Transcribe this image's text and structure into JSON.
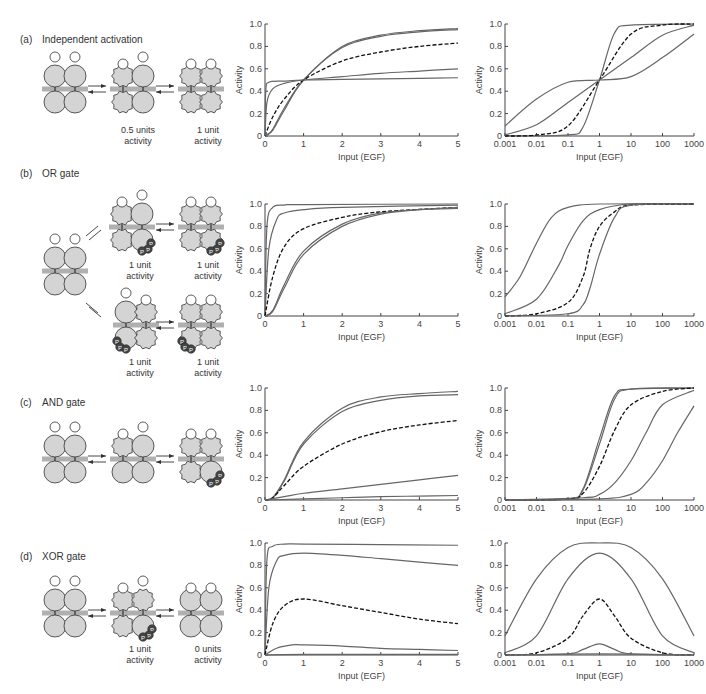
{
  "panels": [
    {
      "id": "a",
      "letter": "(a)",
      "title": "Independent activation",
      "states": [
        {
          "label": ""
        },
        {
          "label": "0.5 units\nactivity",
          "l1": "0.5 units",
          "l2": "activity"
        },
        {
          "label": "1 unit\nactivity",
          "l1": "1 unit",
          "l2": "activity"
        }
      ]
    },
    {
      "id": "b",
      "letter": "(b)",
      "title": "OR gate",
      "states": [
        {
          "l1": "1 unit",
          "l2": "activity"
        },
        {
          "l1": "1 unit",
          "l2": "activity"
        },
        {
          "l1": "1 unit",
          "l2": "activity"
        },
        {
          "l1": "1 unit",
          "l2": "activity"
        }
      ]
    },
    {
      "id": "c",
      "letter": "(c)",
      "title": "AND gate",
      "states": []
    },
    {
      "id": "d",
      "letter": "(d)",
      "title": "XOR gate",
      "states": [
        {
          "l1": "1 unit",
          "l2": "activity"
        },
        {
          "l1": "0 units",
          "l2": "activity"
        }
      ]
    }
  ],
  "axes": {
    "ylabel": "Activity",
    "xlabel": "Input (EGF)",
    "yticks": [
      "0",
      "0.2",
      "0.4",
      "0.6",
      "0.8",
      "1.0"
    ],
    "linear_xticks": [
      "0",
      "1",
      "2",
      "3",
      "4",
      "5"
    ],
    "log_xticks": [
      "0.001",
      "0.01",
      "0.1",
      "1",
      "10",
      "100",
      "1000"
    ]
  },
  "colors": {
    "curve": "#666666",
    "dashed": "#111111",
    "protein": "#d4d4d4",
    "membrane": "#b0b0b0",
    "phospho": "#444444",
    "ligand": "#ffffff"
  },
  "chart_data": [
    {
      "panel": "a",
      "type": "line",
      "scale": "linear",
      "xlabel": "Input (EGF)",
      "ylabel": "Activity",
      "xlim": [
        0,
        5
      ],
      "ylim": [
        0,
        1
      ],
      "series": [
        {
          "name": "steep-1",
          "style": "solid",
          "x": [
            0,
            0.05,
            0.2,
            0.5,
            1,
            2,
            3,
            4,
            5
          ],
          "y": [
            0,
            0.01,
            0.06,
            0.25,
            0.5,
            0.8,
            0.9,
            0.94,
            0.96
          ]
        },
        {
          "name": "steep-2",
          "style": "solid",
          "x": [
            0,
            0.05,
            0.2,
            0.5,
            1,
            2,
            3,
            4,
            5
          ],
          "y": [
            0,
            0.01,
            0.05,
            0.23,
            0.5,
            0.79,
            0.89,
            0.93,
            0.95
          ]
        },
        {
          "name": "hyperbolic",
          "style": "dashed",
          "x": [
            0,
            0.2,
            0.5,
            1,
            2,
            3,
            4,
            5
          ],
          "y": [
            0,
            0.17,
            0.33,
            0.5,
            0.67,
            0.75,
            0.8,
            0.83
          ]
        },
        {
          "name": "shallow-1",
          "style": "solid",
          "x": [
            0,
            0.05,
            0.2,
            0.5,
            1,
            2,
            3,
            4,
            5
          ],
          "y": [
            0,
            0.3,
            0.42,
            0.47,
            0.5,
            0.53,
            0.56,
            0.58,
            0.6
          ]
        },
        {
          "name": "shallow-2",
          "style": "solid",
          "x": [
            0,
            0.02,
            0.1,
            0.5,
            1,
            2,
            3,
            4,
            5
          ],
          "y": [
            0,
            0.4,
            0.48,
            0.49,
            0.5,
            0.505,
            0.51,
            0.515,
            0.52
          ]
        }
      ]
    },
    {
      "panel": "a",
      "type": "line",
      "scale": "log",
      "xlabel": "Input (EGF)",
      "ylabel": "Activity",
      "xlim": [
        0.001,
        1000
      ],
      "ylim": [
        0,
        1
      ],
      "series": [
        {
          "name": "steep",
          "style": "solid",
          "x": [
            0.001,
            0.1,
            0.3,
            1,
            3,
            10,
            1000
          ],
          "y": [
            0,
            0.01,
            0.08,
            0.5,
            0.92,
            0.99,
            1
          ]
        },
        {
          "name": "hyperbolic",
          "style": "dashed",
          "x": [
            0.001,
            0.01,
            0.1,
            1,
            10,
            100,
            1000
          ],
          "y": [
            0,
            0.01,
            0.09,
            0.5,
            0.91,
            0.99,
            1
          ]
        },
        {
          "name": "mid",
          "style": "solid",
          "x": [
            0.001,
            0.01,
            0.1,
            1,
            10,
            100,
            1000
          ],
          "y": [
            0.01,
            0.1,
            0.3,
            0.5,
            0.7,
            0.9,
            0.99
          ]
        },
        {
          "name": "shallow",
          "style": "solid",
          "x": [
            0.001,
            0.01,
            0.1,
            1,
            10,
            100,
            1000
          ],
          "y": [
            0.09,
            0.33,
            0.48,
            0.5,
            0.53,
            0.7,
            0.91
          ]
        }
      ]
    },
    {
      "panel": "b",
      "type": "line",
      "scale": "linear",
      "xlabel": "Input (EGF)",
      "ylabel": "Activity",
      "xlim": [
        0,
        5
      ],
      "ylim": [
        0,
        1
      ],
      "series": [
        {
          "name": "fastest",
          "style": "solid",
          "x": [
            0,
            0.05,
            0.2,
            0.5,
            1,
            5
          ],
          "y": [
            0,
            0.8,
            0.97,
            0.99,
            0.995,
            1
          ]
        },
        {
          "name": "fast",
          "style": "solid",
          "x": [
            0,
            0.1,
            0.3,
            0.5,
            1,
            2,
            5
          ],
          "y": [
            0,
            0.6,
            0.86,
            0.92,
            0.95,
            0.97,
            0.99
          ]
        },
        {
          "name": "hyperbolic",
          "style": "dashed",
          "x": [
            0,
            0.2,
            0.5,
            1,
            2,
            3,
            5
          ],
          "y": [
            0,
            0.35,
            0.62,
            0.78,
            0.88,
            0.93,
            0.97
          ]
        },
        {
          "name": "slow-1",
          "style": "solid",
          "x": [
            0,
            0.2,
            0.5,
            1,
            2,
            3,
            4,
            5
          ],
          "y": [
            0,
            0.05,
            0.28,
            0.58,
            0.82,
            0.92,
            0.95,
            0.97
          ]
        },
        {
          "name": "slow-2",
          "style": "solid",
          "x": [
            0,
            0.2,
            0.5,
            1,
            2,
            3,
            4,
            5
          ],
          "y": [
            0,
            0.04,
            0.25,
            0.55,
            0.8,
            0.91,
            0.95,
            0.96
          ]
        }
      ]
    },
    {
      "panel": "b",
      "type": "line",
      "scale": "log",
      "xlabel": "Input (EGF)",
      "ylabel": "Activity",
      "xlim": [
        0.001,
        1000
      ],
      "ylim": [
        0,
        1
      ],
      "series": [
        {
          "name": "left",
          "style": "solid",
          "x": [
            0.001,
            0.003,
            0.01,
            0.03,
            0.1,
            1,
            1000
          ],
          "y": [
            0.17,
            0.35,
            0.65,
            0.88,
            0.97,
            1,
            1
          ]
        },
        {
          "name": "mid",
          "style": "solid",
          "x": [
            0.001,
            0.01,
            0.05,
            0.1,
            0.3,
            1,
            10,
            1000
          ],
          "y": [
            0.02,
            0.15,
            0.45,
            0.63,
            0.85,
            0.95,
            1,
            1
          ]
        },
        {
          "name": "hyperbolic",
          "style": "dashed",
          "x": [
            0.001,
            0.01,
            0.1,
            0.3,
            0.5,
            1,
            3,
            10,
            1000
          ],
          "y": [
            0,
            0.02,
            0.12,
            0.35,
            0.6,
            0.8,
            0.93,
            0.99,
            1
          ]
        },
        {
          "name": "right",
          "style": "solid",
          "x": [
            0.001,
            0.1,
            0.3,
            0.5,
            1,
            3,
            10,
            1000
          ],
          "y": [
            0,
            0.02,
            0.1,
            0.25,
            0.55,
            0.88,
            0.99,
            1
          ]
        }
      ]
    },
    {
      "panel": "c",
      "type": "line",
      "scale": "linear",
      "xlabel": "Input (EGF)",
      "ylabel": "Activity",
      "xlim": [
        0,
        5
      ],
      "ylim": [
        0,
        1
      ],
      "series": [
        {
          "name": "top-1",
          "style": "solid",
          "x": [
            0,
            0.2,
            0.5,
            1,
            2,
            3,
            4,
            5
          ],
          "y": [
            0,
            0.02,
            0.18,
            0.52,
            0.82,
            0.92,
            0.95,
            0.97
          ]
        },
        {
          "name": "top-2",
          "style": "solid",
          "x": [
            0,
            0.2,
            0.5,
            1,
            2,
            3,
            4,
            5
          ],
          "y": [
            0,
            0.02,
            0.17,
            0.5,
            0.79,
            0.89,
            0.93,
            0.94
          ]
        },
        {
          "name": "hyperbolic",
          "style": "dashed",
          "x": [
            0,
            0.2,
            0.5,
            1,
            2,
            3,
            4,
            5
          ],
          "y": [
            0,
            0.02,
            0.13,
            0.3,
            0.5,
            0.61,
            0.67,
            0.71
          ]
        },
        {
          "name": "low",
          "style": "solid",
          "x": [
            0,
            0.5,
            1,
            2,
            3,
            4,
            5
          ],
          "y": [
            0,
            0.03,
            0.06,
            0.1,
            0.14,
            0.18,
            0.22
          ]
        },
        {
          "name": "flat",
          "style": "solid",
          "x": [
            0,
            1,
            2,
            3,
            4,
            5
          ],
          "y": [
            0,
            0.01,
            0.02,
            0.03,
            0.035,
            0.04
          ]
        }
      ]
    },
    {
      "panel": "c",
      "type": "line",
      "scale": "log",
      "xlabel": "Input (EGF)",
      "ylabel": "Activity",
      "xlim": [
        0.001,
        1000
      ],
      "ylim": [
        0,
        1
      ],
      "series": [
        {
          "name": "steep-1",
          "style": "solid",
          "x": [
            0.001,
            0.1,
            0.3,
            1,
            3,
            10,
            1000
          ],
          "y": [
            0,
            0.01,
            0.1,
            0.55,
            0.93,
            0.99,
            1
          ]
        },
        {
          "name": "steep-2",
          "style": "solid",
          "x": [
            0.001,
            0.1,
            0.3,
            1,
            3,
            10,
            1000
          ],
          "y": [
            0,
            0.01,
            0.09,
            0.5,
            0.9,
            0.99,
            1
          ]
        },
        {
          "name": "hyperbolic",
          "style": "dashed",
          "x": [
            0.001,
            0.1,
            0.3,
            1,
            3,
            10,
            100,
            1000
          ],
          "y": [
            0,
            0.01,
            0.06,
            0.3,
            0.62,
            0.85,
            0.97,
            1
          ]
        },
        {
          "name": "right-1",
          "style": "solid",
          "x": [
            0.001,
            0.3,
            1,
            3,
            10,
            30,
            100,
            1000
          ],
          "y": [
            0,
            0.02,
            0.05,
            0.15,
            0.35,
            0.6,
            0.85,
            0.98
          ]
        },
        {
          "name": "right-2",
          "style": "solid",
          "x": [
            0.001,
            1,
            10,
            30,
            100,
            300,
            1000
          ],
          "y": [
            0,
            0.01,
            0.05,
            0.15,
            0.35,
            0.6,
            0.84
          ]
        }
      ]
    },
    {
      "panel": "d",
      "type": "line",
      "scale": "linear",
      "xlabel": "Input (EGF)",
      "ylabel": "Activity",
      "xlim": [
        0,
        5
      ],
      "ylim": [
        0,
        1
      ],
      "series": [
        {
          "name": "top",
          "style": "solid",
          "x": [
            0,
            0.05,
            0.2,
            0.5,
            1,
            3,
            5
          ],
          "y": [
            0,
            0.85,
            0.97,
            0.99,
            0.99,
            0.985,
            0.98
          ]
        },
        {
          "name": "second",
          "style": "solid",
          "x": [
            0,
            0.1,
            0.3,
            0.5,
            1,
            2,
            3,
            4,
            5
          ],
          "y": [
            0,
            0.6,
            0.84,
            0.89,
            0.91,
            0.89,
            0.86,
            0.83,
            0.8
          ]
        },
        {
          "name": "hyperbolic",
          "style": "dashed",
          "x": [
            0,
            0.2,
            0.5,
            1,
            2,
            3,
            4,
            5
          ],
          "y": [
            0,
            0.28,
            0.44,
            0.5,
            0.44,
            0.38,
            0.32,
            0.28
          ]
        },
        {
          "name": "low",
          "style": "solid",
          "x": [
            0,
            0.3,
            0.7,
            1,
            2,
            3,
            4,
            5
          ],
          "y": [
            0,
            0.06,
            0.09,
            0.09,
            0.08,
            0.06,
            0.05,
            0.04
          ]
        },
        {
          "name": "flat",
          "style": "solid",
          "x": [
            0,
            1,
            5
          ],
          "y": [
            0,
            0.005,
            0.005
          ]
        }
      ]
    },
    {
      "panel": "d",
      "type": "line",
      "scale": "log",
      "xlabel": "Input (EGF)",
      "ylabel": "Activity",
      "xlim": [
        0.001,
        1000
      ],
      "ylim": [
        0,
        1
      ],
      "series": [
        {
          "name": "widest",
          "style": "solid",
          "x": [
            0.001,
            0.01,
            0.1,
            1,
            10,
            100,
            1000
          ],
          "y": [
            0.17,
            0.68,
            0.96,
            1,
            0.96,
            0.68,
            0.17
          ]
        },
        {
          "name": "wide",
          "style": "solid",
          "x": [
            0.001,
            0.01,
            0.1,
            1,
            10,
            100,
            1000
          ],
          "y": [
            0.02,
            0.17,
            0.68,
            0.91,
            0.68,
            0.17,
            0.02
          ]
        },
        {
          "name": "hyperbolic",
          "style": "dashed",
          "x": [
            0.001,
            0.01,
            0.1,
            0.3,
            1,
            3,
            10,
            100,
            1000
          ],
          "y": [
            0,
            0.02,
            0.15,
            0.35,
            0.5,
            0.35,
            0.15,
            0.02,
            0
          ]
        },
        {
          "name": "low",
          "style": "solid",
          "x": [
            0.001,
            0.1,
            0.3,
            1,
            3,
            10,
            1000
          ],
          "y": [
            0,
            0.01,
            0.05,
            0.1,
            0.05,
            0.01,
            0
          ]
        },
        {
          "name": "flat",
          "style": "solid",
          "x": [
            0.001,
            1,
            1000
          ],
          "y": [
            0,
            0.01,
            0
          ]
        }
      ]
    }
  ]
}
